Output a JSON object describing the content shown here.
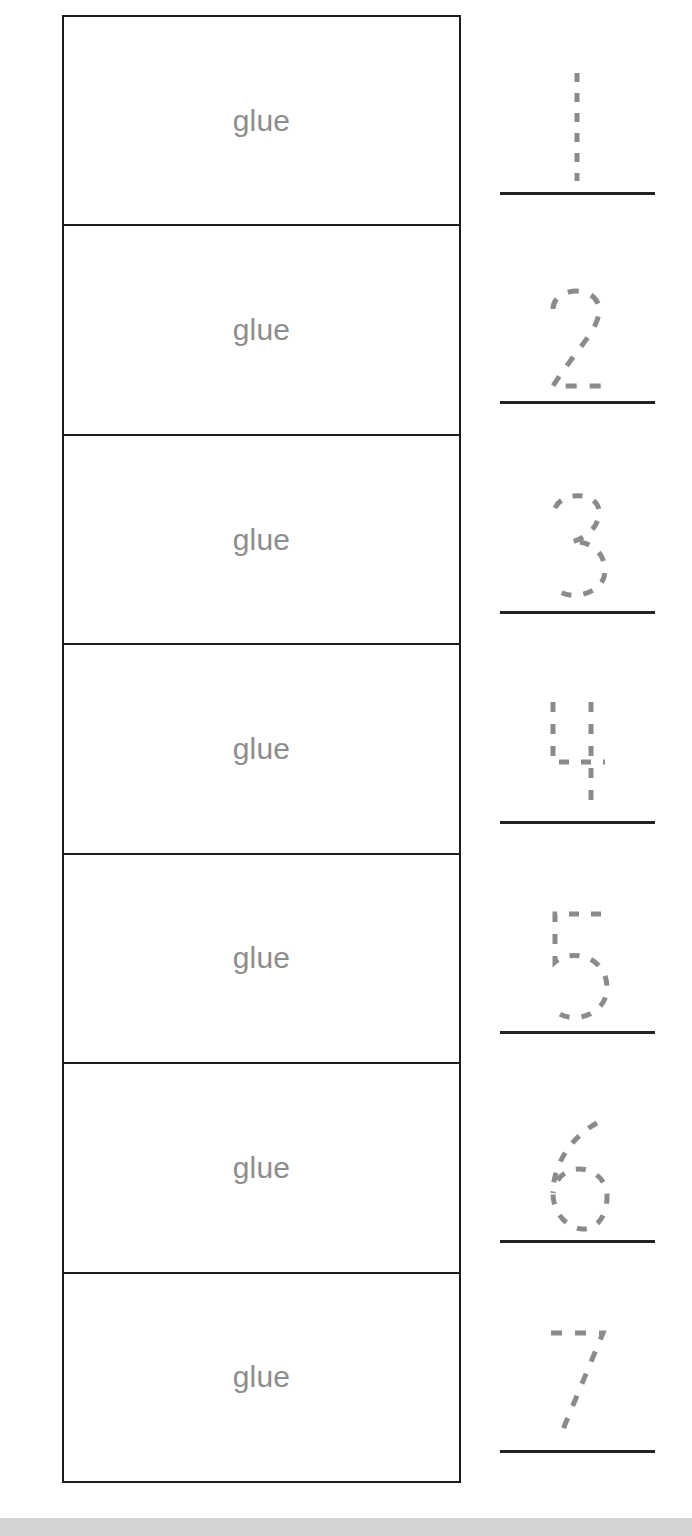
{
  "worksheet": {
    "title": "Number Tracing Worksheet",
    "glue_label": "glue",
    "glue_text_color": "#8d8d8d",
    "box_border_color": "#1d1d1d",
    "trace_stroke_color": "#8b8b8b",
    "baseline_color": "#232323",
    "bottom_strip_color": "#d4d4d4",
    "background_color": "#ffffff",
    "rows": [
      {
        "number": "1",
        "glue": "glue",
        "glyph_name": "dotted-numeral-1"
      },
      {
        "number": "2",
        "glue": "glue",
        "glyph_name": "dotted-numeral-2"
      },
      {
        "number": "3",
        "glue": "glue",
        "glyph_name": "dotted-numeral-3"
      },
      {
        "number": "4",
        "glue": "glue",
        "glyph_name": "dotted-numeral-4"
      },
      {
        "number": "5",
        "glue": "glue",
        "glyph_name": "dotted-numeral-5"
      },
      {
        "number": "6",
        "glue": "glue",
        "glyph_name": "dotted-numeral-6"
      },
      {
        "number": "7",
        "glue": "glue",
        "glyph_name": "dotted-numeral-7"
      }
    ]
  }
}
